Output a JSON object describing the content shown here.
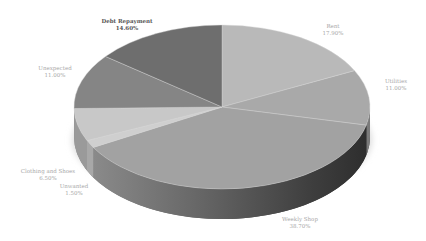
{
  "chart_data": {
    "type": "pie",
    "style": "3d-exploded-none",
    "title": "",
    "legend": "none (data labels on slices)",
    "categories": [
      "Rent",
      "Utilities",
      "Weekly Shop",
      "Unwanted",
      "Clothing and Shoes",
      "Unexpected",
      "Debt Repayment"
    ],
    "values": [
      17.9,
      11.0,
      38.7,
      1.5,
      6.5,
      11.0,
      14.6
    ],
    "labels_formatted": [
      "17.90%",
      "11.00%",
      "38.70%",
      "1.50%",
      "6.50%",
      "11.00%",
      "14.60%"
    ],
    "colors": [
      "#b9b9b9",
      "#a9a9a9",
      "#a2a2a2",
      "#cfcfcf",
      "#c8c8c8",
      "#858585",
      "#6e6e6e"
    ],
    "start_angle_deg": 0,
    "direction": "clockwise"
  },
  "labels": [
    {
      "name": "Rent",
      "value": "17.90%"
    },
    {
      "name": "Utilities",
      "value": "11.00%"
    },
    {
      "name": "Weekly Shop",
      "value": "38.70%"
    },
    {
      "name": "Unwanted",
      "value": "1.50%"
    },
    {
      "name": "Clothing and Shoes",
      "value": "6.50%"
    },
    {
      "name": "Unexpected",
      "value": "11.00%"
    },
    {
      "name": "Debt Repayment",
      "value": "14.60%"
    }
  ]
}
